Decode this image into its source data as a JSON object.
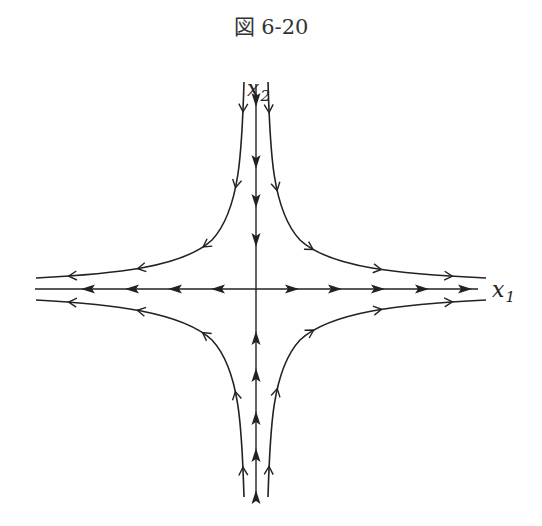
{
  "figure": {
    "caption": "図 6-20",
    "type": "phase-portrait"
  },
  "axes": {
    "x1_label": "x",
    "x1_subscript": "1",
    "x2_label": "x",
    "x2_subscript": "2"
  },
  "flow": {
    "x1_axis_direction": "outward",
    "x2_axis_direction": "inward",
    "trajectories": [
      {
        "quadrant": "upper-right",
        "direction": "down-then-right"
      },
      {
        "quadrant": "upper-left",
        "direction": "down-then-left"
      },
      {
        "quadrant": "lower-right",
        "direction": "up-then-right"
      },
      {
        "quadrant": "lower-left",
        "direction": "up-then-left"
      }
    ]
  },
  "colors": {
    "line": "#222222",
    "background": "#ffffff"
  }
}
